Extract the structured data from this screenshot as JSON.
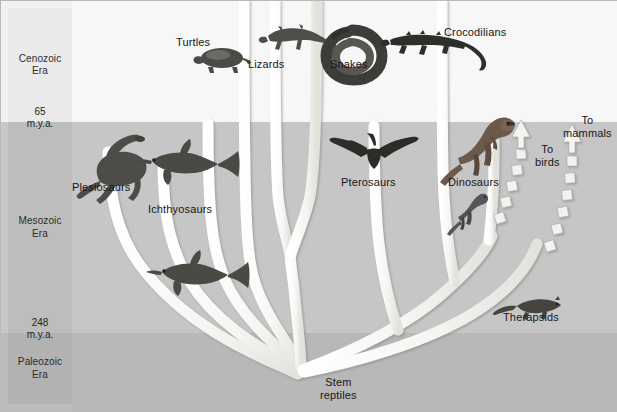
{
  "figure": {
    "width": 617,
    "height": 412
  },
  "timescale": {
    "eras": [
      {
        "name": "Cenozoic",
        "suffix": "Era",
        "label": "Cenozoic\nEra",
        "top_px": 0,
        "height_px": 122,
        "color": "#eaeaea"
      },
      {
        "name": "Mesozoic",
        "suffix": "Era",
        "label": "Mesozoic\nEra",
        "top_px": 122,
        "height_px": 211,
        "color": "#bdbdbd"
      },
      {
        "name": "Paleozoic",
        "suffix": "Era",
        "label": "Paleozoic\nEra",
        "top_px": 333,
        "height_px": 79,
        "color": "#b2b2b2"
      }
    ],
    "boundaries": [
      {
        "value": "65",
        "unit": "m.y.a.",
        "y_px": 122
      },
      {
        "value": "248",
        "unit": "m.y.a.",
        "y_px": 333
      }
    ]
  },
  "tree": {
    "root_label": "Stem\nreptiles",
    "root_label_line1": "Stem",
    "root_label_line2": "reptiles",
    "branch_color": "#f5f4f1",
    "branch_edge_color": "#9a9a9a",
    "taxa": [
      {
        "id": "turtles",
        "label": "Turtles",
        "icon": "turtle-silhouette"
      },
      {
        "id": "lizards",
        "label": "Lizards",
        "icon": "lizard-silhouette"
      },
      {
        "id": "snakes",
        "label": "Snakes",
        "icon": "snake-silhouette"
      },
      {
        "id": "crocodilians",
        "label": "Crocodilians",
        "icon": "crocodile-silhouette"
      },
      {
        "id": "plesiosaurs",
        "label": "Plesiosaurs",
        "icon": "plesiosaur-silhouette"
      },
      {
        "id": "ichthyosaurs",
        "label": "Ichthyosaurs",
        "icon": "ichthyosaur-silhouette"
      },
      {
        "id": "pterosaurs",
        "label": "Pterosaurs",
        "icon": "pterosaur-silhouette"
      },
      {
        "id": "dinosaurs",
        "label": "Dinosaurs",
        "icon": "dinosaur-silhouette"
      },
      {
        "id": "therapsids",
        "label": "Therapsids",
        "icon": "therapsid-silhouette"
      }
    ],
    "outgoing_arrows": [
      {
        "id": "to-birds",
        "label": "To\nbirds",
        "line1": "To",
        "line2": "birds",
        "style": "dashed-arrow-up"
      },
      {
        "id": "to-mammals",
        "label": "To\nmammals",
        "line1": "To",
        "line2": "mammals",
        "style": "dashed-arrow-up"
      }
    ]
  },
  "colors": {
    "cenozoic_band": "#f2f2f2",
    "mesozoic_band": "#c8c8c8",
    "paleozoic_band": "#bcbcbc",
    "branch": "#f5f4f1",
    "text": "#16161a",
    "frame": "#b9b9b9"
  }
}
